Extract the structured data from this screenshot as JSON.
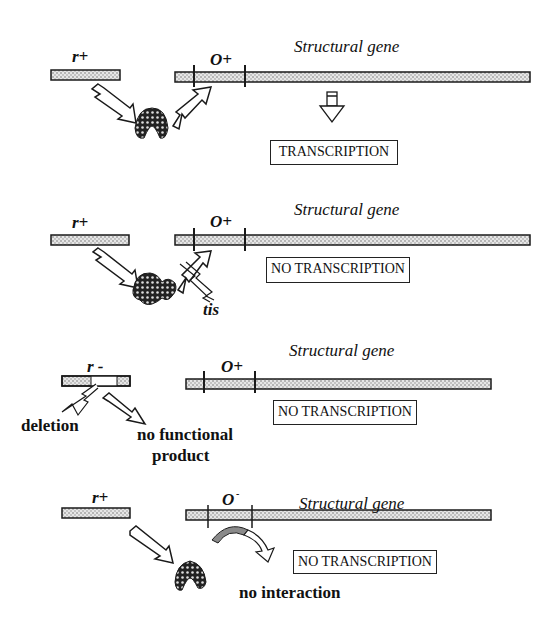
{
  "colors": {
    "bar_fill": "#d8d8d8",
    "outline": "#1a1a1a",
    "repressor": "#2a2a2a",
    "grey_arrow": "#8a8a8a"
  },
  "panels": [
    {
      "id": "wild-type",
      "regulator_label": "r+",
      "operator_label": "O+",
      "gene_label": "Structural gene",
      "result": "TRANSCRIPTION"
    },
    {
      "id": "operator-mutation-tis",
      "regulator_label": "r+",
      "operator_label": "O+",
      "gene_label": "Structural gene",
      "result": "NO TRANSCRIPTION",
      "annotation": "tis"
    },
    {
      "id": "regulator-deletion",
      "regulator_label": "r -",
      "operator_label": "O+",
      "gene_label": "Structural gene",
      "result": "NO TRANSCRIPTION",
      "annotations": [
        "deletion",
        "no functional",
        "product"
      ]
    },
    {
      "id": "operator-constitutive",
      "regulator_label": "r+",
      "operator_label": "O",
      "operator_superscript": "-",
      "gene_label": "Structural gene",
      "result": "NO TRANSCRIPTION",
      "annotation": "no interaction"
    }
  ]
}
